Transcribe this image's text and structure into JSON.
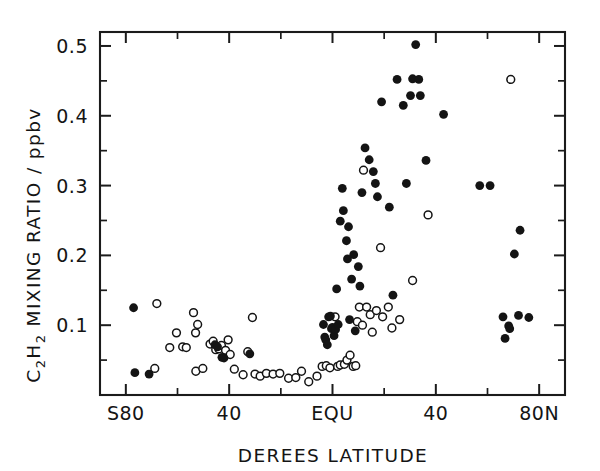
{
  "chart_data": {
    "type": "scatter",
    "title": "",
    "xlabel": "DEREES LATITUDE",
    "ylabel": "C2H2 MIXING RATIO / ppbv",
    "ylabel_parts": {
      "species_1": "C",
      "species_sub_1": "2",
      "species_2": "H",
      "species_sub_2": "2",
      "rest": " MIXING RATIO / ppbv"
    },
    "xlim": [
      -90,
      90
    ],
    "ylim": [
      0.0,
      0.52
    ],
    "grid": false,
    "legend": "none",
    "xticklabels": [
      "S80",
      "40",
      "EQU",
      "40",
      "80N"
    ],
    "xtickvalues": [
      -80,
      -40,
      0,
      40,
      80
    ],
    "xminor_step": 20,
    "yticklabels": [
      "0.1",
      "0.2",
      "0.3",
      "0.4",
      "0.5"
    ],
    "ytickvalues": [
      0.1,
      0.2,
      0.3,
      0.4,
      0.5
    ],
    "marker_colors": {
      "filled": "#141414",
      "open_stroke": "#141414",
      "open_fill": "#ffffff"
    },
    "series": [
      {
        "name": "filled-circles",
        "marker": "filled circle",
        "points": [
          [
            -77.0,
            0.125
          ],
          [
            -76.5,
            0.032
          ],
          [
            -71.0,
            0.03
          ],
          [
            -45.5,
            0.072
          ],
          [
            -44.5,
            0.069
          ],
          [
            -42.0,
            0.053
          ],
          [
            -42.8,
            0.054
          ],
          [
            -32.0,
            0.059
          ],
          [
            -3.5,
            0.101
          ],
          [
            -3.0,
            0.083
          ],
          [
            -2.6,
            0.079
          ],
          [
            -2.0,
            0.072
          ],
          [
            -1.5,
            0.112
          ],
          [
            -0.8,
            0.113
          ],
          [
            -0.4,
            0.095
          ],
          [
            0.0,
            0.097
          ],
          [
            0.6,
            0.085
          ],
          [
            1.2,
            0.094
          ],
          [
            1.6,
            0.152
          ],
          [
            2.2,
            0.101
          ],
          [
            3.0,
            0.249
          ],
          [
            3.8,
            0.296
          ],
          [
            4.2,
            0.264
          ],
          [
            5.4,
            0.221
          ],
          [
            5.8,
            0.195
          ],
          [
            6.2,
            0.241
          ],
          [
            6.6,
            0.108
          ],
          [
            7.4,
            0.166
          ],
          [
            8.2,
            0.201
          ],
          [
            8.8,
            0.092
          ],
          [
            10.0,
            0.184
          ],
          [
            10.6,
            0.156
          ],
          [
            11.4,
            0.29
          ],
          [
            12.6,
            0.354
          ],
          [
            14.2,
            0.337
          ],
          [
            15.8,
            0.32
          ],
          [
            16.6,
            0.303
          ],
          [
            17.4,
            0.284
          ],
          [
            19.0,
            0.42
          ],
          [
            22.0,
            0.269
          ],
          [
            23.4,
            0.143
          ],
          [
            25.0,
            0.452
          ],
          [
            27.4,
            0.415
          ],
          [
            28.6,
            0.303
          ],
          [
            30.2,
            0.429
          ],
          [
            31.0,
            0.453
          ],
          [
            32.2,
            0.502
          ],
          [
            33.4,
            0.452
          ],
          [
            34.0,
            0.429
          ],
          [
            36.2,
            0.336
          ],
          [
            43.0,
            0.402
          ],
          [
            57.0,
            0.3
          ],
          [
            61.0,
            0.3
          ],
          [
            66.0,
            0.112
          ],
          [
            66.8,
            0.081
          ],
          [
            68.2,
            0.099
          ],
          [
            68.6,
            0.095
          ],
          [
            70.4,
            0.202
          ],
          [
            72.6,
            0.236
          ],
          [
            72.0,
            0.114
          ],
          [
            76.0,
            0.111
          ]
        ]
      },
      {
        "name": "open-circles",
        "marker": "open circle",
        "points": [
          [
            -68.0,
            0.131
          ],
          [
            -68.8,
            0.038
          ],
          [
            -63.0,
            0.068
          ],
          [
            -60.4,
            0.089
          ],
          [
            -58.0,
            0.069
          ],
          [
            -56.6,
            0.068
          ],
          [
            -53.0,
            0.089
          ],
          [
            -53.8,
            0.118
          ],
          [
            -52.2,
            0.101
          ],
          [
            -52.9,
            0.034
          ],
          [
            -50.2,
            0.038
          ],
          [
            -47.4,
            0.073
          ],
          [
            -46.2,
            0.077
          ],
          [
            -45.2,
            0.065
          ],
          [
            -44.0,
            0.066
          ],
          [
            -43.0,
            0.071
          ],
          [
            -41.4,
            0.064
          ],
          [
            -40.4,
            0.079
          ],
          [
            -39.6,
            0.058
          ],
          [
            -38.0,
            0.037
          ],
          [
            -34.6,
            0.029
          ],
          [
            -32.8,
            0.062
          ],
          [
            -31.0,
            0.111
          ],
          [
            -30.0,
            0.03
          ],
          [
            -28.0,
            0.027
          ],
          [
            -25.6,
            0.031
          ],
          [
            -23.0,
            0.03
          ],
          [
            -20.4,
            0.031
          ],
          [
            -17.0,
            0.024
          ],
          [
            -14.2,
            0.025
          ],
          [
            -12.0,
            0.034
          ],
          [
            -9.2,
            0.019
          ],
          [
            -6.0,
            0.027
          ],
          [
            -4.0,
            0.041
          ],
          [
            -2.4,
            0.042
          ],
          [
            -1.0,
            0.039
          ],
          [
            1.0,
            0.112
          ],
          [
            2.0,
            0.041
          ],
          [
            3.0,
            0.043
          ],
          [
            4.6,
            0.044
          ],
          [
            5.6,
            0.05
          ],
          [
            6.8,
            0.057
          ],
          [
            8.0,
            0.041
          ],
          [
            9.0,
            0.042
          ],
          [
            9.6,
            0.105
          ],
          [
            10.4,
            0.126
          ],
          [
            11.6,
            0.1
          ],
          [
            12.0,
            0.322
          ],
          [
            13.2,
            0.126
          ],
          [
            14.6,
            0.115
          ],
          [
            15.4,
            0.09
          ],
          [
            17.0,
            0.121
          ],
          [
            18.6,
            0.211
          ],
          [
            19.4,
            0.112
          ],
          [
            21.6,
            0.126
          ],
          [
            23.0,
            0.096
          ],
          [
            26.0,
            0.108
          ],
          [
            31.0,
            0.164
          ],
          [
            37.0,
            0.258
          ],
          [
            69.0,
            0.452
          ]
        ]
      }
    ]
  },
  "axes": {
    "frame_color": "#1b1b1b"
  }
}
